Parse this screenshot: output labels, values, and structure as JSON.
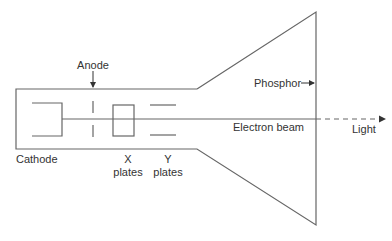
{
  "diagram": {
    "labels": {
      "anode": "Anode",
      "cathode": "Cathode",
      "x_plates_line1": "X",
      "x_plates_line2": "plates",
      "y_plates_line1": "Y",
      "y_plates_line2": "plates",
      "phosphor": "Phosphor",
      "electron_beam": "Electron beam",
      "light": "Light"
    },
    "colors": {
      "line": "#666666",
      "text": "#333333",
      "background": "#ffffff"
    }
  }
}
